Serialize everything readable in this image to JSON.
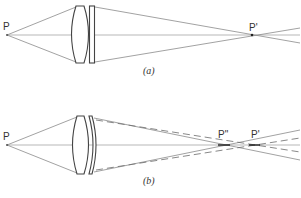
{
  "figure": {
    "panel_a": {
      "caption": "(a)",
      "object_label": "P",
      "image_label": "P'",
      "elements": [
        "biconvex-lens",
        "plane-parallel-plate"
      ]
    },
    "panel_b": {
      "caption": "(b)",
      "object_label": "P",
      "image_label_primary": "P\"",
      "image_label_secondary": "P'",
      "elements": [
        "biconvex-lens",
        "meniscus-lens"
      ],
      "legend_hint": "solid rays focus at P\", dashed rays focus at P'"
    }
  },
  "colors": {
    "ray": "#8a8a8a",
    "lens_outline": "#444444",
    "background": "#ffffff"
  }
}
